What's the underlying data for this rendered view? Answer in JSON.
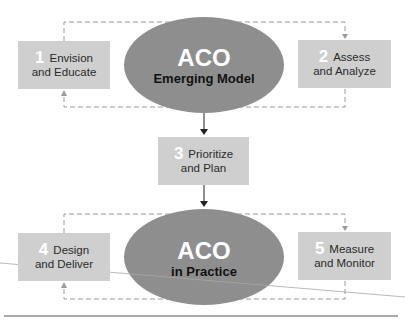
{
  "diagram": {
    "colors": {
      "box_fill": "#cfcfcf",
      "ellipse_fill": "#8e8e8e",
      "number_color": "#ffffff",
      "dash_color": "#9a9a9a",
      "arrow_color": "#222222"
    },
    "top_ellipse": {
      "title": "ACO",
      "subtitle": "Emerging Model"
    },
    "bottom_ellipse": {
      "title": "ACO",
      "subtitle": "in Practice"
    },
    "steps": [
      {
        "number": "1",
        "line1": "Envision",
        "line2": "and Educate"
      },
      {
        "number": "2",
        "line1": "Assess",
        "line2": "and Analyze"
      },
      {
        "number": "3",
        "line1": "Prioritize",
        "line2": "and Plan"
      },
      {
        "number": "4",
        "line1": "Design",
        "line2": "and Deliver"
      },
      {
        "number": "5",
        "line1": "Measure",
        "line2": "and Monitor"
      }
    ]
  }
}
